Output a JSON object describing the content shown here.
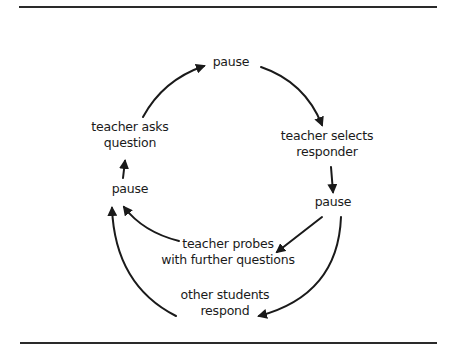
{
  "diagram": {
    "type": "cycle",
    "nodes": [
      {
        "id": "pause_top",
        "lines": [
          "pause"
        ]
      },
      {
        "id": "teacher_selects",
        "lines": [
          "teacher selects",
          "responder"
        ]
      },
      {
        "id": "pause_right",
        "lines": [
          "pause"
        ]
      },
      {
        "id": "teacher_probes",
        "lines": [
          "teacher probes",
          "with further questions"
        ]
      },
      {
        "id": "other_students",
        "lines": [
          "other students",
          "respond"
        ]
      },
      {
        "id": "pause_left",
        "lines": [
          "pause"
        ]
      },
      {
        "id": "teacher_asks",
        "lines": [
          "teacher asks",
          "question"
        ]
      }
    ],
    "edges": [
      {
        "from": "teacher_asks",
        "to": "pause_top"
      },
      {
        "from": "pause_top",
        "to": "teacher_selects"
      },
      {
        "from": "teacher_selects",
        "to": "pause_right"
      },
      {
        "from": "pause_right",
        "to": "teacher_probes"
      },
      {
        "from": "pause_right",
        "to": "other_students"
      },
      {
        "from": "teacher_probes",
        "to": "pause_left"
      },
      {
        "from": "other_students",
        "to": "pause_left"
      },
      {
        "from": "pause_left",
        "to": "teacher_asks"
      }
    ],
    "colors": {
      "line": "#1a1a1a",
      "rule": "#2a2a2a",
      "background": "#ffffff"
    }
  }
}
